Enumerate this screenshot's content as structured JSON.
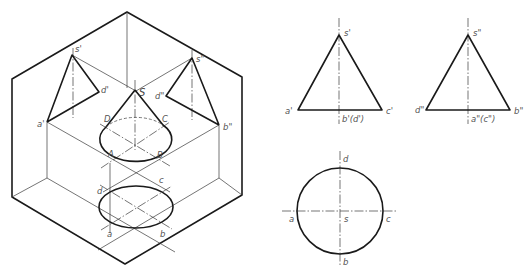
{
  "figure": {
    "isometric": {
      "labels": {
        "s_front": "s'",
        "d_front": "d'",
        "a_front": "a'",
        "s_side": "s\"",
        "d_side": "d\"",
        "b_side": "b\"",
        "S": "S",
        "A": "A",
        "B": "B",
        "C": "C",
        "D": "D",
        "a": "a",
        "b": "b",
        "c": "c",
        "d": "d"
      }
    },
    "front_view": {
      "labels": {
        "apex": "s'",
        "left": "a'",
        "right": "c'",
        "bottom": "b'(d')"
      }
    },
    "side_view": {
      "labels": {
        "apex": "s\"",
        "left": "d\"",
        "right": "b\"",
        "bottom": "a\"(c\")"
      }
    },
    "top_view": {
      "labels": {
        "top": "d",
        "left": "a",
        "right": "c",
        "bottom": "b",
        "center": "s"
      }
    }
  }
}
